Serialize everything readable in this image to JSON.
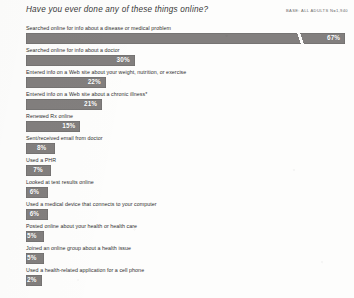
{
  "header": {
    "title": "Have you ever done any of these things online?",
    "base_note": "BASE: ALL ADULTS n=1,940"
  },
  "chart_data": {
    "type": "bar",
    "orientation": "horizontal",
    "title": "Have you ever done any of these things online?",
    "xlabel": "",
    "ylabel": "",
    "xlim": [
      0,
      70
    ],
    "grid": false,
    "legend": false,
    "value_suffix": "%",
    "axis_break": {
      "present": true,
      "on_category": "Searched online for info about a disease or medical problem",
      "note": "Top bar is compressed with a diagonal break mark; not drawn to scale."
    },
    "footnote_marker": "*",
    "categories": [
      "Searched online for info about a disease or medical problem",
      "Searched online for info about a doctor",
      "Entered info on a Web site about your weight, nutrition, or exercise",
      "Entered info on a Web site about a chronic illness*",
      "Renewed Rx online",
      "Sent/received email from doctor",
      "Used a PHR",
      "Looked at test results online",
      "Used a medical device that connects to your computer",
      "Posted online about your health or health care",
      "Joined an online group about a health issue",
      "Used a health-related application for a cell phone"
    ],
    "values": [
      67,
      30,
      22,
      21,
      15,
      8,
      7,
      6,
      6,
      5,
      5,
      2
    ],
    "value_labels": [
      "67%",
      "30%",
      "22%",
      "21%",
      "15%",
      "8%",
      "7%",
      "6%",
      "6%",
      "5%",
      "5%",
      "2%"
    ]
  },
  "style": {
    "bar_color": "#827f7e",
    "value_text_color": "#ffffff",
    "label_text_color": "#2f2f2f",
    "background": "#fdfdfc"
  }
}
